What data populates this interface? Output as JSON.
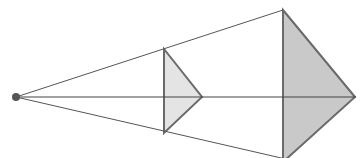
{
  "diagram": {
    "colors": {
      "background": "#ffffff",
      "line": "#555555",
      "edge": "#6a6a6a",
      "small_fill": "#e4e4e4",
      "large_fill": "#c9c9c9",
      "eye": "#555555"
    },
    "eye_point": {
      "x": 16,
      "y": 97,
      "r": 4
    },
    "axis": {
      "x1": 16,
      "y1": 97,
      "x2": 356,
      "y2": 97
    },
    "rays": [
      {
        "x1": 16,
        "y1": 97,
        "x2": 283,
        "y2": 10
      },
      {
        "x1": 16,
        "y1": 97,
        "x2": 290,
        "y2": 160
      }
    ],
    "small_triangle": {
      "points": "164,49 202,97 164,133"
    },
    "large_triangle": {
      "points": "283,10 355,97 283,162"
    }
  }
}
